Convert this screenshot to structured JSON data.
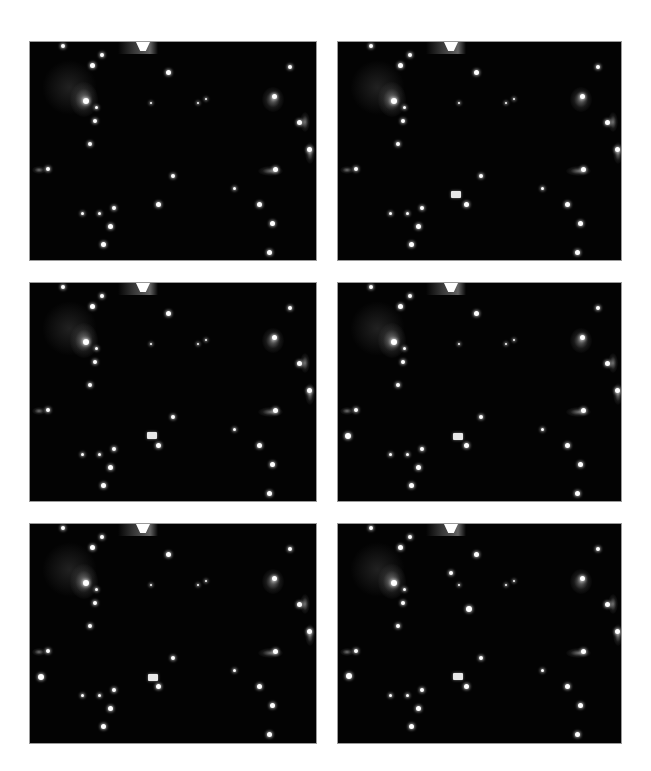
{
  "figure": {
    "layout": {
      "rows": 3,
      "cols": 2
    },
    "background": "#ffffff",
    "panel_color": "#030303",
    "panels": [
      {
        "id": "frame-1",
        "x": 30,
        "y": 42,
        "w": 286,
        "h": 218,
        "extra_spots": []
      },
      {
        "id": "frame-2",
        "x": 338,
        "y": 42,
        "w": 283,
        "h": 218,
        "extra_spots": [
          [
            118,
            152,
            5
          ]
        ]
      },
      {
        "id": "frame-3",
        "x": 30,
        "y": 283,
        "w": 286,
        "h": 218,
        "extra_spots": [
          [
            122,
            152,
            5
          ]
        ]
      },
      {
        "id": "frame-4",
        "x": 338,
        "y": 283,
        "w": 283,
        "h": 218,
        "extra_spots": [
          [
            120,
            153,
            5
          ],
          [
            10,
            153,
            3
          ]
        ]
      },
      {
        "id": "frame-5",
        "x": 30,
        "y": 524,
        "w": 286,
        "h": 219,
        "extra_spots": [
          [
            123,
            153,
            5
          ],
          [
            11,
            153,
            3
          ]
        ]
      },
      {
        "id": "frame-6",
        "x": 338,
        "y": 524,
        "w": 283,
        "h": 219,
        "extra_spots": [
          [
            120,
            152,
            5
          ],
          [
            11,
            152,
            3
          ],
          [
            113,
            49,
            2
          ],
          [
            131,
            85,
            3
          ]
        ]
      }
    ],
    "common_spots": [
      [
        33,
        4,
        2
      ],
      [
        72,
        13,
        2
      ],
      [
        62,
        23,
        2.5
      ],
      [
        138,
        30,
        2.5
      ],
      [
        260,
        25,
        2
      ],
      [
        56,
        59,
        3
      ],
      [
        66,
        65,
        1.5
      ],
      [
        65,
        79,
        2
      ],
      [
        60,
        102,
        2
      ],
      [
        18,
        127,
        2
      ],
      [
        244,
        54,
        2.5
      ],
      [
        269,
        80,
        2.5
      ],
      [
        279,
        107,
        2.5
      ],
      [
        245,
        127,
        2.5
      ],
      [
        121,
        61,
        1
      ],
      [
        168,
        61,
        1
      ],
      [
        176,
        57,
        1
      ],
      [
        143,
        134,
        2
      ],
      [
        204,
        146,
        1.5
      ],
      [
        128,
        162,
        2.5
      ],
      [
        229,
        162,
        2.5
      ],
      [
        242,
        181,
        2.5
      ],
      [
        239,
        210,
        2.5
      ],
      [
        80,
        184,
        2.5
      ],
      [
        73,
        202,
        2.5
      ],
      [
        52,
        171,
        1.5
      ],
      [
        69,
        171,
        1.5
      ],
      [
        84,
        166,
        2
      ]
    ],
    "glows": [
      [
        40,
        40,
        28,
        35
      ],
      [
        232,
        45,
        22,
        25
      ],
      [
        2,
        124,
        14,
        8
      ],
      [
        228,
        124,
        25,
        10
      ],
      [
        270,
        70,
        10,
        20
      ],
      [
        275,
        100,
        10,
        22
      ]
    ],
    "top_notch": {
      "x": 106,
      "glow_x": 88,
      "glow_w": 40
    }
  }
}
